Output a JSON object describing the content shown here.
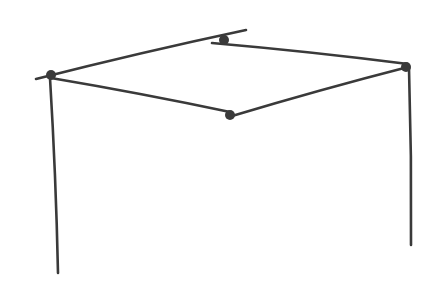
{
  "drawing": {
    "description": "pencil sketch of a quadrilateral frame supported by two vertical legs",
    "stroke_color": "#3a3a3a",
    "background": "#ffffff",
    "nodes": [
      {
        "id": "left",
        "x": 51,
        "y": 75
      },
      {
        "id": "back",
        "x": 224,
        "y": 40
      },
      {
        "id": "right",
        "x": 406,
        "y": 67
      },
      {
        "id": "front",
        "x": 230,
        "y": 115
      }
    ],
    "edges": [
      {
        "id": "left-back",
        "x1": 36,
        "y1": 79,
        "x2": 246,
        "y2": 30
      },
      {
        "id": "back-right",
        "x1": 212,
        "y1": 43,
        "x2": 408,
        "y2": 64
      },
      {
        "id": "left-front",
        "x1": 51,
        "y1": 78,
        "x2": 230,
        "y2": 112
      },
      {
        "id": "front-right",
        "x1": 232,
        "y1": 116,
        "x2": 408,
        "y2": 67
      },
      {
        "id": "left-leg",
        "x1": 50,
        "y1": 78,
        "x2": 58,
        "y2": 273
      },
      {
        "id": "right-leg",
        "x1": 409,
        "y1": 68,
        "x2": 411,
        "y2": 245
      }
    ]
  }
}
